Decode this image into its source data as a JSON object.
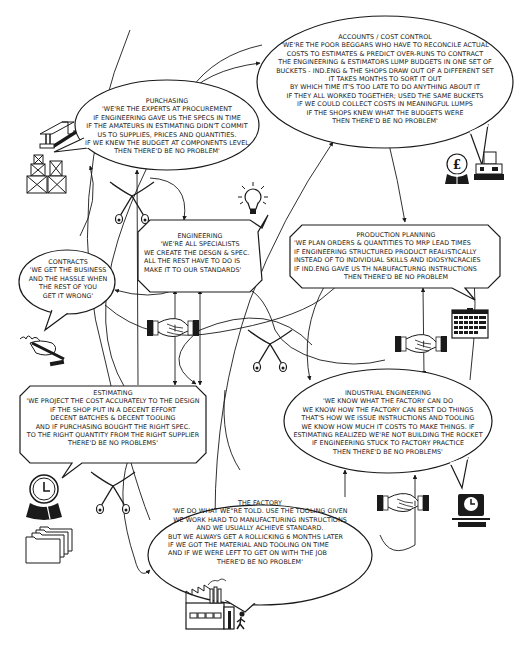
{
  "diagram": {
    "type": "departmental-blame-map",
    "background": "#ffffff",
    "ink": "#1a1a1a"
  },
  "bubbles": {
    "accounts": {
      "title": "ACCOUNTS / COST CONTROL",
      "lines": [
        "'WE'RE THE POOR BEGGARS WHO HAVE TO RECONCILE ACTUAL",
        "COSTS TO ESTIMATES & PREDICT OVER-RUNS TO CONTRACT",
        "THE ENGINEERING & ESTIMATORS LUMP BUDGETS IN ONE SET OF",
        "BUCKETS - IND.ENG & THE SHOPS DRAW OUT OF A DIFFERENT SET",
        "IT TAKES MONTHS TO SORT IT OUT",
        "BY WHICH TIME IT'S TOO LATE TO DO ANYTHING ABOUT IT",
        "IF THEY ALL WORKED TOGETHER; USED THE SAME BUCKETS",
        "IF WE COULD COLLECT COSTS IN MEANINGFUL LUMPS",
        "IF THE SHOPS KNEW WHAT THE BUDGETS WERE",
        "THEN THERE'D BE NO PROBLEM'"
      ],
      "shape": "ellipse"
    },
    "purchasing": {
      "title": "PURCHASING",
      "lines": [
        "'WE'RE THE EXPERTS AT PROCUREMENT",
        "IF ENGINEERING GAVE US THE SPECS IN TIME",
        "IF THE AMATEURS IN ESTIMATING DIDN'T COMMIT",
        "US TO SUPPLIES, PRICES AND QUANTITIES.",
        "IF WE KNEW THE BUDGET AT COMPONENTS LEVEL",
        "THEN THERE'D BE NO PROBLEM'"
      ],
      "shape": "ellipse"
    },
    "engineering": {
      "title": "ENGINEERING",
      "lines": [
        "'WE'RE ALL SPECIALISTS",
        "WE CREATE THE DESGN & SPEC.",
        "ALL THE REST HAVE TO DO IS",
        "MAKE IT TO OUR STANDARDS'"
      ],
      "shape": "octagon"
    },
    "production_planning": {
      "title": "PRODUCTION PLANNING",
      "lines": [
        "'WE PLAN ORDERS & QUANTITIES TO MRP LEAD TIMES",
        "IF ENGINEERING STRUCTURED PRODUCT REALISTICALLY",
        "INSTEAD OF TO INDIVIDUAL SKILLS AND IDIOSYNCRACIES",
        "IF IND.ENG GAVE US TH NABUFACTURNG INSTRUCTIONS",
        "THEN THERE'D BE NO PROBLEM"
      ],
      "shape": "octagon"
    },
    "contracts": {
      "title": "CONTRACTS",
      "lines": [
        "'WE GET THE BUSINESS",
        "AND THE HASSLE WHEN",
        "THE REST OF YOU",
        "GET IT WRONG'"
      ],
      "shape": "ellipse"
    },
    "estimating": {
      "title": "ESTIMATING",
      "lines": [
        "'WE PROJECT THE COST ACCURATELY TO THE DESIGN",
        "IF THE SHOP PUT IN A DECENT EFFORT",
        "DECENT BATCHES & DECENT TOOLING",
        "AND IF PURCHASING BOUGHT THE RIGHT SPEC.",
        "TO THE RIGHT QUANTITY FROM THE RIGHT SUPPLIER",
        "THERE'D BE NO PROBLEMS'"
      ],
      "shape": "octagon"
    },
    "industrial_engineering": {
      "title": "INDUSTRIAL ENGINEERING",
      "lines": [
        "'WE KNOW WHAT THE FACTORY CAN DO",
        "WE KNOW HOW THE FACTORY CAN BEST DO THINGS",
        "THAT'S HOW WE ISSUE INSTRUCTIONS AND TOOLING",
        "WE KNOW HOW MUCH IT COSTS TO MAKE THINGS. IF",
        "ESTIMATING REALIZED WE'RE NOT BUILDING THE ROCKET",
        "IF ENGINEERING STUCK TO FACTORY PRACTICE",
        "THEN THERE'D BE NO PROBLEMS'"
      ],
      "shape": "ellipse"
    },
    "factory": {
      "title": "THE FACTORY",
      "lines": [
        "'WE DO WHAT WE\"RE TOLD. USE THE TOOLING GIVEN",
        "WE WORK HARD TO MANUFACTURING INSTRUCTIONS",
        "AND WE USUALLY ACHIEVE STANDARD.",
        "BUT WE ALWAYS GET A ROLLICKING 6 MONTHS LATER",
        "IF WE GOT THE MATERIAL AND TOOLING ON TIME",
        "AND IF WE WERE LEFT TO GET ON WITH THE JOB",
        "THERE'D BE NO PROBLEM'"
      ],
      "shape": "ellipse"
    }
  },
  "icons": [
    {
      "name": "steel-beam-icon",
      "near": "purchasing"
    },
    {
      "name": "stacked-crates-icon",
      "near": "purchasing"
    },
    {
      "name": "pound-globe-icon",
      "near": "accounts"
    },
    {
      "name": "cash-register-icon",
      "near": "accounts"
    },
    {
      "name": "light-bulb-icon",
      "near": "engineering"
    },
    {
      "name": "calendar-icon",
      "near": "production_planning"
    },
    {
      "name": "signing-hand-icon",
      "near": "contracts"
    },
    {
      "name": "clock-globe-icon",
      "near": "estimating"
    },
    {
      "name": "file-folders-icon",
      "near": "estimating"
    },
    {
      "name": "time-clock-icon",
      "near": "industrial_engineering"
    },
    {
      "name": "factory-icon",
      "near": "factory"
    },
    {
      "name": "crossed-swords-icon",
      "count": 3
    },
    {
      "name": "handshake-icon",
      "count": 3
    }
  ]
}
